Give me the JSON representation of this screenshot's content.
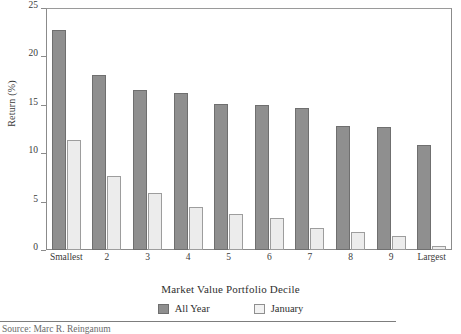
{
  "chart_data": {
    "type": "bar",
    "title": "",
    "subtitle": "",
    "xlabel": "Market Value Portfolio Decile",
    "ylabel": "Return (%)",
    "ylim": [
      0,
      25
    ],
    "yticks": [
      0,
      5,
      10,
      15,
      20,
      25
    ],
    "ytick_labels": [
      "0",
      "5",
      "10",
      "15",
      "20",
      "25"
    ],
    "grid": false,
    "legend_position": "bottom-center",
    "categories": [
      "Smallest",
      "2",
      "3",
      "4",
      "5",
      "6",
      "7",
      "8",
      "9",
      "Largest"
    ],
    "series": [
      {
        "name": "All Year",
        "color": "#8f8f8f",
        "values": [
          22.7,
          18.1,
          16.5,
          16.2,
          15.1,
          15.0,
          14.7,
          12.8,
          12.7,
          10.8
        ]
      },
      {
        "name": "January",
        "color": "#ececec",
        "values": [
          11.4,
          7.6,
          5.9,
          4.4,
          3.7,
          3.3,
          2.3,
          1.9,
          1.4,
          0.4
        ]
      }
    ],
    "source_note": "Source: Marc R. Reinganum"
  },
  "legend": {
    "items": [
      {
        "label": "All Year",
        "swatch": "dark-gray-square"
      },
      {
        "label": "January",
        "swatch": "light-gray-square"
      }
    ]
  },
  "colors": {
    "all_year": "#8f8f8f",
    "january": "#ececec",
    "frame": "#8b8b8b",
    "text": "#2f2f2f",
    "background": "#ffffff"
  }
}
